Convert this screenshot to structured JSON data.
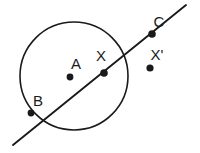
{
  "figure": {
    "background_color": "#ffffff",
    "ink_color": "#1a1a1a",
    "canvas": {
      "width": 200,
      "height": 153
    },
    "circle": {
      "name": "circle-A",
      "center_x": 74,
      "center_y": 76,
      "radius": 54,
      "stroke_width": 1.6
    },
    "line": {
      "name": "secant-line",
      "x1": 13,
      "y1": 145,
      "x2": 186,
      "y2": 5,
      "stroke_width": 1.9
    },
    "points": [
      {
        "id": "A",
        "label": "A",
        "role": "center",
        "cx": 70,
        "cy": 77,
        "r": 3.4,
        "label_x": 76,
        "label_y": 69
      },
      {
        "id": "B",
        "label": "B",
        "role": "on-circle",
        "cx": 31,
        "cy": 113,
        "r": 3.4,
        "label_x": 38,
        "label_y": 106
      },
      {
        "id": "X",
        "label": "X",
        "role": "intersection",
        "cx": 104,
        "cy": 73,
        "r": 3.8,
        "label_x": 101,
        "label_y": 61
      },
      {
        "id": "C",
        "label": "C",
        "role": "on-line",
        "cx": 152,
        "cy": 34,
        "r": 3.8,
        "label_x": 159,
        "label_y": 27
      },
      {
        "id": "Xprime",
        "label": "X'",
        "role": "external",
        "cx": 150,
        "cy": 68,
        "r": 3.6,
        "label_x": 157,
        "label_y": 60
      }
    ]
  }
}
